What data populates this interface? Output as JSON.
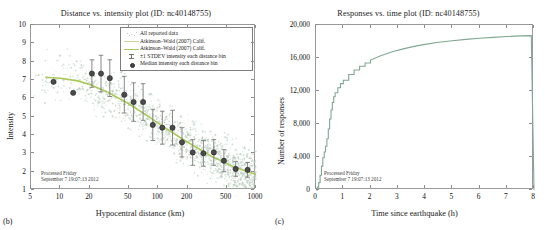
{
  "figure": {
    "panel_b_label": "(b)",
    "panel_c_label": "(c)",
    "watermark_line1": "Processed Friday",
    "watermark_line2": "September 7 19:07:13 2012",
    "colors": {
      "model_line": "#a9c957",
      "scatter": "#b9cdbd",
      "median_marker": "#4b4b4b",
      "errorbar": "#7a7a7a",
      "step_curve": "#7fa893",
      "axis": "#9a9a9a"
    }
  },
  "chart_data": [
    {
      "type": "scatter",
      "panel": "(b)",
      "title": "Distance vs. intensity plot (ID: nc40148755)",
      "xlabel": "Hypocentral distance (km)",
      "ylabel": "Intensity",
      "xscale": "log",
      "xlim": [
        5,
        1000
      ],
      "ylim": [
        1,
        10
      ],
      "xticks": [
        5,
        10,
        20,
        50,
        100,
        200,
        500,
        1000
      ],
      "xticklabels": [
        "5",
        "10",
        "20",
        "50",
        "100",
        "200",
        "500",
        "1000"
      ],
      "yticks": [
        1,
        2,
        3,
        4,
        5,
        6,
        7,
        8,
        9,
        10
      ],
      "yticklabels": [
        "1",
        "2",
        "3",
        "4",
        "5",
        "6",
        "7",
        "8",
        "9",
        "10"
      ],
      "grid": false,
      "legend_position": "upper right",
      "legend": [
        {
          "label": "All reported data",
          "key": "dots"
        },
        {
          "label": "Atkinson–Wald (2007) Calif.",
          "key": "line-light"
        },
        {
          "label": "Atkinson–Wald (2007) Calif.",
          "key": "line-dark"
        },
        {
          "label": "±1 STDEV intensity each distance bin",
          "key": "errorbar"
        },
        {
          "label": "Median intensity each distance bin",
          "key": "marker"
        }
      ],
      "series": [
        {
          "name": "Median intensity each distance bin",
          "x": [
            8.5,
            13.5,
            21,
            26,
            32,
            45,
            56,
            70,
            88,
            110,
            140,
            175,
            225,
            290,
            370,
            470,
            620,
            820
          ],
          "y": [
            6.9,
            6.3,
            7.35,
            7.35,
            7.1,
            6.2,
            5.8,
            5.8,
            4.55,
            4.4,
            4.4,
            3.6,
            3.05,
            3.0,
            3.05,
            2.6,
            2.15,
            2.1
          ],
          "yerr_low": [
            6.9,
            6.3,
            6.6,
            6.35,
            6.1,
            5.2,
            4.75,
            4.8,
            3.7,
            3.5,
            3.45,
            2.8,
            2.35,
            2.3,
            2.35,
            2.0,
            1.75,
            1.7
          ],
          "yerr_high": [
            6.9,
            6.3,
            8.1,
            8.35,
            8.1,
            7.2,
            6.85,
            6.8,
            5.4,
            5.3,
            5.35,
            4.4,
            3.75,
            3.7,
            3.75,
            3.2,
            2.55,
            2.5
          ]
        },
        {
          "name": "Atkinson–Wald (2007) Calif.",
          "x": [
            7,
            10,
            15,
            20,
            30,
            50,
            80,
            120,
            200,
            350,
            600,
            1000
          ],
          "y": [
            7.15,
            7.1,
            6.95,
            6.75,
            6.35,
            5.7,
            5.0,
            4.35,
            3.6,
            2.85,
            2.25,
            1.85
          ]
        }
      ]
    },
    {
      "type": "line",
      "panel": "(c)",
      "title": "Responses vs. time plot (ID: nc40148755)",
      "xlabel": "Time since earthquake (h)",
      "ylabel": "Number of responses",
      "xlim": [
        0,
        8
      ],
      "ylim": [
        0,
        20000
      ],
      "xticks": [
        0,
        1,
        2,
        3,
        4,
        5,
        6,
        7,
        8
      ],
      "xticklabels": [
        "0",
        "1",
        "2",
        "3",
        "4",
        "5",
        "6",
        "7",
        "8"
      ],
      "yticks": [
        0,
        4000,
        8000,
        12000,
        16000,
        20000
      ],
      "yticklabels": [
        "0",
        "4,000",
        "8,000",
        "12,000",
        "16,000",
        "20,000"
      ],
      "grid": false,
      "legend_position": "none",
      "series": [
        {
          "name": "Cumulative responses",
          "x": [
            0.0,
            0.05,
            0.1,
            0.15,
            0.2,
            0.25,
            0.3,
            0.35,
            0.4,
            0.45,
            0.5,
            0.55,
            0.6,
            0.65,
            0.7,
            0.8,
            0.9,
            1.0,
            1.2,
            1.4,
            1.6,
            1.8,
            2.0,
            2.4,
            2.8,
            3.2,
            3.6,
            4.0,
            4.5,
            5.0,
            5.5,
            6.0,
            6.5,
            7.0,
            7.5,
            7.9,
            8.0
          ],
          "y": [
            0,
            350,
            900,
            1800,
            2900,
            3900,
            4600,
            5300,
            6200,
            7400,
            8600,
            9700,
            10600,
            11300,
            11800,
            12400,
            12900,
            13300,
            14000,
            14550,
            15000,
            15400,
            15750,
            16300,
            16750,
            17100,
            17400,
            17650,
            17900,
            18100,
            18250,
            18400,
            18500,
            18600,
            18680,
            18720,
            0
          ]
        }
      ]
    }
  ]
}
